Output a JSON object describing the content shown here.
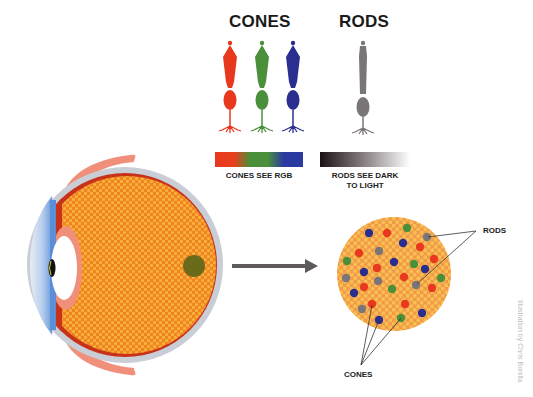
{
  "headings": {
    "cones": "CONES",
    "rods": "RODS"
  },
  "captions": {
    "cones": "CONES SEE RGB",
    "rods_line1": "RODS SEE DARK",
    "rods_line2": "TO LIGHT"
  },
  "labels": {
    "rods": "RODS",
    "cones": "CONES"
  },
  "credit": "Illustration by Chris Bonilla",
  "colors": {
    "red_cone": "#e8381e",
    "green_cone": "#4a8f3a",
    "blue_cone": "#2a2f8f",
    "rod": "#7a7578",
    "retina_orange": "#f08a1e",
    "retina_dot": "#f6b43a",
    "fovea": "#6b6a1a",
    "sclera": "#c9cdd6",
    "eyelid": "#f0907a",
    "cornea": "#5a8fd8",
    "arrow": "#5e5a5c"
  },
  "mosaic_dots": [
    {
      "x": 369,
      "y": 233,
      "c": "blue"
    },
    {
      "x": 387,
      "y": 233,
      "c": "red"
    },
    {
      "x": 407,
      "y": 228,
      "c": "green"
    },
    {
      "x": 427,
      "y": 237,
      "c": "gray"
    },
    {
      "x": 403,
      "y": 243,
      "c": "blue"
    },
    {
      "x": 420,
      "y": 247,
      "c": "red"
    },
    {
      "x": 359,
      "y": 253,
      "c": "red"
    },
    {
      "x": 379,
      "y": 251,
      "c": "gray"
    },
    {
      "x": 347,
      "y": 261,
      "c": "green"
    },
    {
      "x": 394,
      "y": 262,
      "c": "blue"
    },
    {
      "x": 414,
      "y": 264,
      "c": "green"
    },
    {
      "x": 434,
      "y": 259,
      "c": "red"
    },
    {
      "x": 377,
      "y": 268,
      "c": "red"
    },
    {
      "x": 364,
      "y": 272,
      "c": "blue"
    },
    {
      "x": 425,
      "y": 269,
      "c": "blue"
    },
    {
      "x": 346,
      "y": 278,
      "c": "gray"
    },
    {
      "x": 378,
      "y": 281,
      "c": "gray"
    },
    {
      "x": 404,
      "y": 277,
      "c": "red"
    },
    {
      "x": 441,
      "y": 278,
      "c": "green"
    },
    {
      "x": 364,
      "y": 287,
      "c": "red"
    },
    {
      "x": 392,
      "y": 289,
      "c": "green"
    },
    {
      "x": 416,
      "y": 285,
      "c": "gray"
    },
    {
      "x": 432,
      "y": 288,
      "c": "red"
    },
    {
      "x": 354,
      "y": 293,
      "c": "blue"
    },
    {
      "x": 372,
      "y": 304,
      "c": "red"
    },
    {
      "x": 362,
      "y": 309,
      "c": "gray"
    },
    {
      "x": 405,
      "y": 304,
      "c": "red"
    },
    {
      "x": 379,
      "y": 320,
      "c": "blue"
    },
    {
      "x": 401,
      "y": 318,
      "c": "green"
    },
    {
      "x": 422,
      "y": 313,
      "c": "blue"
    }
  ]
}
